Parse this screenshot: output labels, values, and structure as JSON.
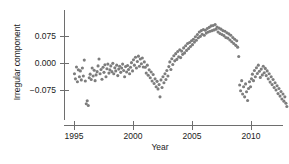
{
  "chart_data": {
    "type": "scatter",
    "title": "",
    "xlabel": "Year",
    "ylabel": "Irregular component",
    "xlim": [
      1994.6,
      2013.4
    ],
    "ylim": [
      -0.165,
      0.12
    ],
    "grid": false,
    "legend": null,
    "xticks": [
      1995,
      2000,
      2005,
      2010
    ],
    "xtick_labels": [
      "1995",
      "2000",
      "2005",
      "2010"
    ],
    "yticks": [
      0.075,
      0.0,
      -0.075
    ],
    "ytick_labels": [
      "0.075",
      "0.000",
      "-0.075"
    ],
    "marker": {
      "shape": "circle",
      "color": "#7d7d7d",
      "size_px": 3.1
    },
    "axis_color": "#6e6e6e",
    "series": [
      {
        "name": "Irregular component",
        "x": [
          1995.04,
          1995.12,
          1995.21,
          1995.29,
          1995.37,
          1995.46,
          1995.54,
          1995.62,
          1995.71,
          1995.79,
          1995.87,
          1995.96,
          1996.04,
          1996.12,
          1996.21,
          1996.29,
          1996.37,
          1996.46,
          1996.54,
          1996.62,
          1996.71,
          1996.79,
          1996.87,
          1996.96,
          1997.04,
          1997.12,
          1997.21,
          1997.29,
          1997.37,
          1997.46,
          1997.54,
          1997.62,
          1997.71,
          1997.79,
          1997.87,
          1997.96,
          1998.04,
          1998.12,
          1998.21,
          1998.29,
          1998.37,
          1998.46,
          1998.54,
          1998.62,
          1998.71,
          1998.79,
          1998.87,
          1998.96,
          1999.04,
          1999.12,
          1999.21,
          1999.29,
          1999.37,
          1999.46,
          1999.54,
          1999.62,
          1999.71,
          1999.79,
          1999.87,
          1999.96,
          2000.04,
          2000.12,
          2000.21,
          2000.29,
          2000.37,
          2000.46,
          2000.54,
          2000.62,
          2000.71,
          2000.79,
          2000.87,
          2000.96,
          2001.04,
          2001.12,
          2001.21,
          2001.29,
          2001.37,
          2001.46,
          2001.54,
          2001.62,
          2001.71,
          2001.79,
          2001.87,
          2001.96,
          2002.04,
          2002.12,
          2002.21,
          2002.29,
          2002.37,
          2002.46,
          2002.54,
          2002.62,
          2002.71,
          2002.79,
          2002.87,
          2002.96,
          2003.04,
          2003.12,
          2003.21,
          2003.29,
          2003.37,
          2003.46,
          2003.54,
          2003.62,
          2003.71,
          2003.79,
          2003.87,
          2003.96,
          2004.04,
          2004.12,
          2004.21,
          2004.29,
          2004.37,
          2004.46,
          2004.54,
          2004.62,
          2004.71,
          2004.79,
          2004.87,
          2004.96,
          2005.04,
          2005.12,
          2005.21,
          2005.29,
          2005.37,
          2005.46,
          2005.54,
          2005.62,
          2005.71,
          2005.79,
          2005.87,
          2005.96,
          2006.04,
          2006.12,
          2006.21,
          2006.29,
          2006.37,
          2006.46,
          2006.54,
          2006.62,
          2006.71,
          2006.79,
          2006.87,
          2006.96,
          2007.04,
          2007.12,
          2007.21,
          2007.29,
          2007.37,
          2007.46,
          2007.54,
          2007.62,
          2007.71,
          2007.79,
          2007.87,
          2007.96,
          2008.04,
          2008.12,
          2008.21,
          2008.29,
          2008.37,
          2008.46,
          2008.54,
          2008.62,
          2008.71,
          2008.79,
          2008.87,
          2008.96,
          2009.04,
          2009.12,
          2009.21,
          2009.29,
          2009.37,
          2009.46,
          2009.54,
          2009.62,
          2009.71,
          2009.79,
          2009.87,
          2009.96,
          2010.04,
          2010.12,
          2010.21,
          2010.29,
          2010.37,
          2010.46,
          2010.54,
          2010.62,
          2010.71,
          2010.79,
          2010.87,
          2010.96,
          2011.04,
          2011.12,
          2011.21,
          2011.29,
          2011.37,
          2011.46,
          2011.54,
          2011.62,
          2011.71,
          2011.79,
          2011.87,
          2011.96,
          2012.04,
          2012.12,
          2012.21,
          2012.29,
          2012.37,
          2012.46,
          2012.54,
          2012.62,
          2012.71,
          2012.79,
          2012.87,
          2012.96,
          2013.04,
          2013.12,
          2013.21
        ],
        "y": [
          -0.03,
          -0.044,
          -0.011,
          -0.052,
          -0.019,
          -0.038,
          -0.022,
          -0.047,
          -0.014,
          -0.036,
          0.008,
          -0.05,
          -0.113,
          -0.105,
          -0.118,
          -0.041,
          -0.031,
          -0.046,
          -0.014,
          -0.036,
          -0.02,
          -0.049,
          -0.033,
          -0.024,
          -0.008,
          0.011,
          -0.03,
          -0.018,
          -0.045,
          -0.012,
          -0.026,
          -0.005,
          -0.038,
          -0.016,
          -0.003,
          -0.028,
          -0.019,
          -0.008,
          -0.024,
          -0.001,
          -0.03,
          -0.013,
          -0.022,
          -0.006,
          -0.035,
          -0.017,
          -0.009,
          -0.026,
          -0.014,
          -0.003,
          -0.021,
          -0.038,
          -0.01,
          -0.025,
          -0.007,
          -0.018,
          -0.03,
          -0.012,
          0.001,
          -0.022,
          0.009,
          -0.006,
          0.016,
          -0.014,
          0.004,
          0.019,
          -0.009,
          0.011,
          -0.002,
          0.014,
          -0.011,
          0.003,
          -0.012,
          -0.028,
          -0.006,
          -0.034,
          -0.019,
          -0.041,
          -0.025,
          -0.05,
          -0.032,
          -0.057,
          -0.044,
          -0.066,
          -0.051,
          -0.072,
          -0.06,
          -0.094,
          -0.047,
          -0.068,
          -0.038,
          -0.055,
          -0.03,
          -0.046,
          -0.021,
          -0.036,
          -0.01,
          0.003,
          -0.018,
          0.012,
          -0.004,
          0.02,
          0.006,
          0.026,
          0.01,
          0.032,
          0.017,
          0.037,
          0.015,
          0.033,
          0.024,
          0.042,
          0.028,
          0.048,
          0.035,
          0.054,
          0.04,
          0.057,
          0.046,
          0.062,
          0.051,
          0.066,
          0.058,
          0.073,
          0.063,
          0.079,
          0.07,
          0.086,
          0.074,
          0.09,
          0.08,
          0.093,
          0.077,
          0.091,
          0.083,
          0.096,
          0.086,
          0.099,
          0.088,
          0.103,
          0.09,
          0.104,
          0.092,
          0.107,
          0.094,
          0.1,
          0.086,
          0.097,
          0.082,
          0.094,
          0.079,
          0.09,
          0.076,
          0.088,
          0.071,
          0.084,
          0.069,
          0.081,
          0.064,
          0.077,
          0.059,
          0.071,
          0.054,
          0.066,
          0.049,
          0.062,
          0.044,
          0.018,
          -0.061,
          -0.077,
          -0.049,
          -0.086,
          -0.066,
          -0.094,
          -0.058,
          -0.08,
          -0.104,
          -0.071,
          -0.052,
          -0.066,
          -0.044,
          -0.031,
          -0.049,
          -0.021,
          -0.038,
          -0.013,
          -0.029,
          -0.006,
          -0.023,
          -0.04,
          -0.017,
          -0.033,
          -0.009,
          -0.027,
          -0.015,
          -0.035,
          -0.022,
          -0.044,
          -0.03,
          -0.053,
          -0.038,
          -0.06,
          -0.046,
          -0.068,
          -0.055,
          -0.075,
          -0.063,
          -0.085,
          -0.071,
          -0.092,
          -0.079,
          -0.1,
          -0.086,
          -0.106,
          -0.094,
          -0.112,
          -0.121,
          -0.145,
          -0.138
        ]
      }
    ]
  }
}
